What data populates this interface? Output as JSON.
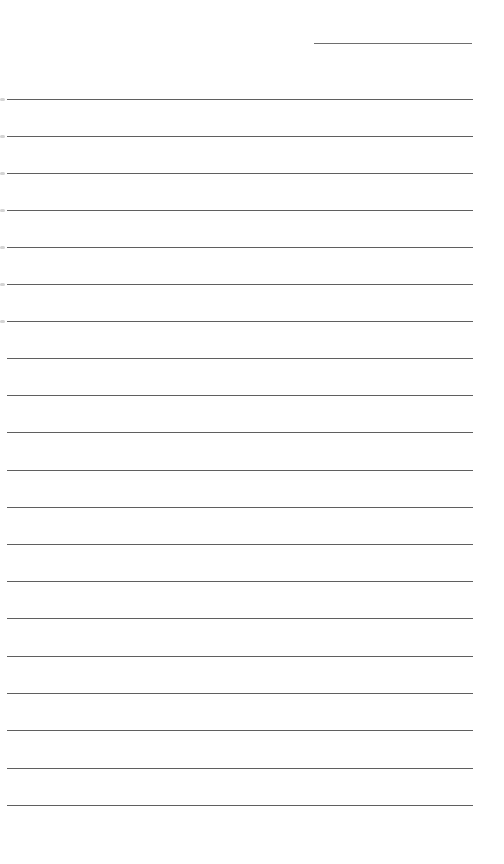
{
  "page": {
    "type": "lined-paper",
    "background_color": "#ffffff",
    "line_color": "#5f5f5f",
    "date_line": {
      "x": 314,
      "y": 43,
      "width": 158
    },
    "rules": {
      "count": 20,
      "x": 7,
      "width": 466,
      "y_positions": [
        99,
        136,
        173,
        210,
        247,
        284,
        321,
        358,
        395,
        432,
        470,
        507,
        544,
        581,
        618,
        656,
        693,
        730,
        768,
        805
      ]
    },
    "margin_marks": {
      "count": 7,
      "y_positions": [
        99,
        136,
        173,
        210,
        247,
        284,
        321
      ]
    }
  }
}
